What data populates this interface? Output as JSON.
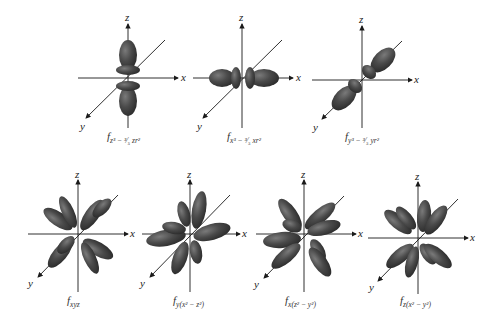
{
  "figure": {
    "axis_labels": {
      "x": "x",
      "y": "y",
      "z": "z"
    },
    "lobe_color": "#3a3a3a",
    "lobe_highlight": "#6e6e6e",
    "orbitals": [
      {
        "id": "fz3",
        "label_main": "f",
        "label_sub": "z³ − ³⁄₅ zr²"
      },
      {
        "id": "fx3",
        "label_main": "f",
        "label_sub": "x³ − ³⁄₅ xr²"
      },
      {
        "id": "fy3",
        "label_main": "f",
        "label_sub": "y³ − ³⁄₅ yr²"
      },
      {
        "id": "fxyz",
        "label_main": "f",
        "label_sub": "xyz"
      },
      {
        "id": "fyx2z2",
        "label_main": "f",
        "label_sub": "y(x² − z²)"
      },
      {
        "id": "fxz2y2",
        "label_main": "f",
        "label_sub": "x(z² − y²)"
      },
      {
        "id": "fzx2y2",
        "label_main": "f",
        "label_sub": "z(x² − y²)"
      }
    ]
  }
}
